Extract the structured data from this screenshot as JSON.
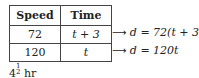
{
  "table": {
    "headers": [
      "Speed",
      "Time"
    ],
    "rows": [
      {
        "speed": "72",
        "time": "t + 3"
      },
      {
        "speed": "120",
        "time": "t"
      }
    ]
  },
  "equations": [
    {
      "arrow": "⟶",
      "text": "d = 72(t + 3)"
    },
    {
      "arrow": "⟶",
      "text": "d = 120t"
    }
  ],
  "footer": {
    "whole": "4",
    "numerator": "1",
    "denominator": "2",
    "unit": "hr"
  }
}
